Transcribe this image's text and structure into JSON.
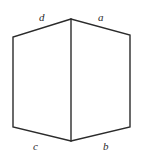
{
  "figure": {
    "name": "cube-outline-diagram",
    "background_color": "#ffffff",
    "stroke_color": "#2b2b2b",
    "stroke_width": 1.4,
    "canvas": {
      "width": 141,
      "height": 160
    },
    "vertices": {
      "top_center": {
        "x": 71,
        "y": 19
      },
      "top_left": {
        "x": 13,
        "y": 37
      },
      "top_right": {
        "x": 130,
        "y": 35
      },
      "bottom_left": {
        "x": 13,
        "y": 127
      },
      "bottom_right": {
        "x": 130,
        "y": 127
      },
      "bottom_center": {
        "x": 71,
        "y": 141
      }
    },
    "outline_path": "M 71 19 L 13 37 L 13 127 L 71 141 L 130 127 L 130 35 Z",
    "center_edge_path": "M 71 19 L 71 141",
    "labels": [
      {
        "id": "d",
        "text": "d",
        "edge": "top-left-slant",
        "position": "above"
      },
      {
        "id": "a",
        "text": "a",
        "edge": "top-right-slant",
        "position": "above"
      },
      {
        "id": "c",
        "text": "c",
        "edge": "bottom-left-slant",
        "position": "below"
      },
      {
        "id": "b",
        "text": "b",
        "edge": "bottom-right-slant",
        "position": "below"
      }
    ]
  }
}
